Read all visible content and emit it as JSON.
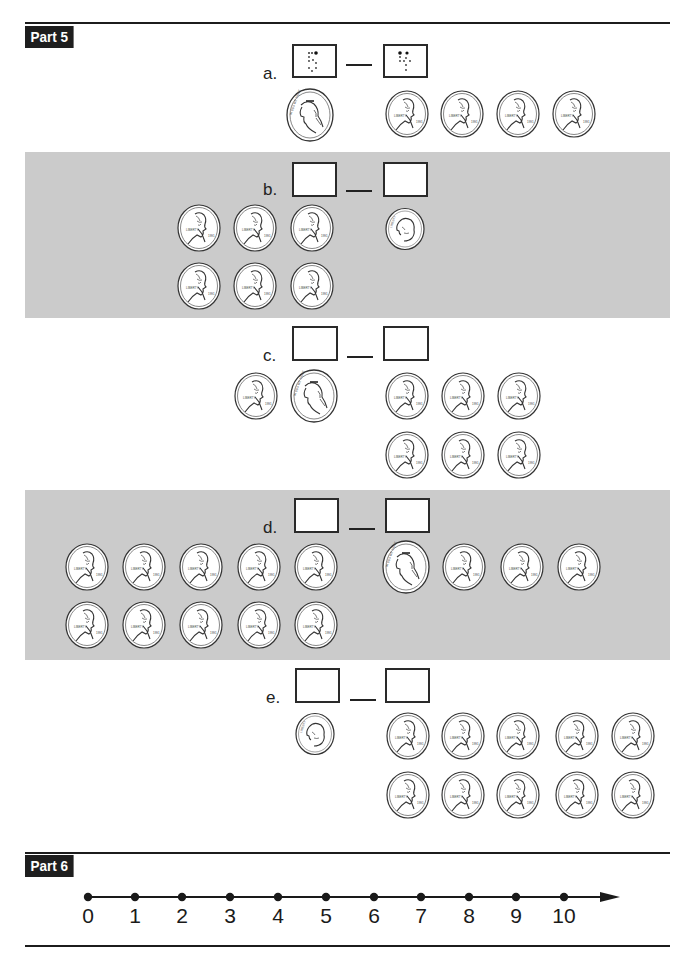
{
  "parts": {
    "part5": {
      "label": "Part 5"
    },
    "part6": {
      "label": "Part 6"
    }
  },
  "problems": [
    {
      "id": "a",
      "label": "a.",
      "left_box": "5 (dotted trace)",
      "right_box": "4 (dotted trace)",
      "left_coins": [
        "nickel"
      ],
      "right_coins": [
        "penny",
        "penny",
        "penny",
        "penny"
      ]
    },
    {
      "id": "b",
      "label": "b.",
      "left_box": "",
      "right_box": "",
      "left_coins": [
        "penny",
        "penny",
        "penny",
        "penny",
        "penny",
        "penny"
      ],
      "right_coins": [
        "dime"
      ]
    },
    {
      "id": "c",
      "label": "c.",
      "left_box": "",
      "right_box": "",
      "left_coins": [
        "penny",
        "nickel"
      ],
      "right_coins": [
        "penny",
        "penny",
        "penny",
        "penny",
        "penny",
        "penny"
      ]
    },
    {
      "id": "d",
      "label": "d.",
      "left_box": "",
      "right_box": "",
      "left_coins": [
        "penny",
        "penny",
        "penny",
        "penny",
        "penny",
        "penny",
        "penny",
        "penny",
        "penny",
        "penny"
      ],
      "right_coins": [
        "nickel",
        "penny",
        "penny",
        "penny"
      ]
    },
    {
      "id": "e",
      "label": "e.",
      "left_box": "",
      "right_box": "",
      "left_coins": [
        "dime"
      ],
      "right_coins": [
        "penny",
        "penny",
        "penny",
        "penny",
        "penny",
        "penny",
        "penny",
        "penny",
        "penny",
        "penny"
      ]
    }
  ],
  "number_line": {
    "ticks": [
      "0",
      "1",
      "2",
      "3",
      "4",
      "5",
      "6",
      "7",
      "8",
      "9",
      "10"
    ]
  },
  "colors": {
    "band_gray": "#cbcbcb",
    "label_bg": "#1e1e1e"
  }
}
